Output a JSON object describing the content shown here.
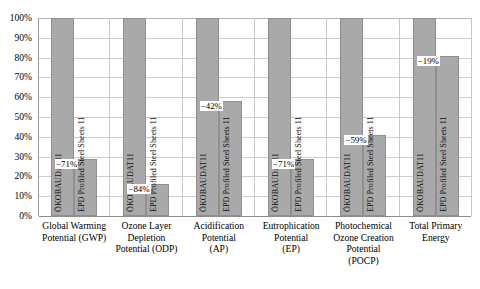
{
  "chart_data": {
    "type": "bar",
    "title": "",
    "subtitle": "",
    "xlabel": "",
    "ylabel": "",
    "ylim": [
      0,
      100
    ],
    "grid": true,
    "legend_position": "in-bar",
    "y_ticks": [
      "0%",
      "10%",
      "20%",
      "30%",
      "40%",
      "50%",
      "60%",
      "70%",
      "80%",
      "90%",
      "100%"
    ],
    "y_tick_values": [
      0,
      10,
      20,
      30,
      40,
      50,
      60,
      70,
      80,
      90,
      100
    ],
    "categories": [
      "Global Warming Potential (GWP)",
      "Ozone Layer Depletion Potential (ODP)",
      "Acidification Potential (AP)",
      "Eutrophication Potential (EP)",
      "Photochemical Ozone Creation Potential (POCP)",
      "Total Primary Energy"
    ],
    "category_lines": [
      [
        "Global Warming",
        "Potential (GWP)"
      ],
      [
        "Ozone Layer",
        "Depletion",
        "Potential (ODP)"
      ],
      [
        "Acidification",
        "Potential",
        "(AP)"
      ],
      [
        "Eutrophication",
        "Potential",
        "(EP)"
      ],
      [
        "Photochemical",
        "Ozone Creation",
        "Potential",
        "(POCP)"
      ],
      [
        "Total Primary",
        "Energy"
      ]
    ],
    "series": [
      {
        "name": "ÖKOBAUDAT11",
        "values": [
          100,
          100,
          100,
          100,
          100,
          100
        ],
        "labels": [
          "",
          "",
          "",
          "",
          "",
          ""
        ]
      },
      {
        "name": "EPD Profiled Steel Sheets 11",
        "values": [
          29,
          16,
          58,
          29,
          41,
          81
        ],
        "labels": [
          "−71%",
          "−84%",
          "−42%",
          "−71%",
          "−59%",
          "−19%"
        ]
      }
    ],
    "bar_color": "#a9a9a9",
    "bar_border_color": "#8f8f8f",
    "gridline_color": "#cfcfcf",
    "axis_color": "#8d8d8d",
    "background_color": "#ffffff"
  }
}
